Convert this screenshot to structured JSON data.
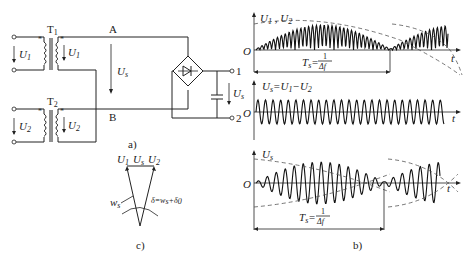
{
  "circuit": {
    "transformer1_label": "T",
    "transformer1_sub": "1",
    "transformer2_label": "T",
    "transformer2_sub": "2",
    "node_a": "A",
    "node_b": "B",
    "input1_label": "U",
    "input1_sub": "1",
    "output1_label": "U",
    "output1_sub": "1",
    "input2_label": "U",
    "input2_sub": "2",
    "output2_label": "U",
    "output2_sub": "2",
    "diff_voltage_label": "U",
    "diff_voltage_sub": "s",
    "terminal1": "1",
    "terminal2": "2",
    "out_voltage_label": "U",
    "out_voltage_sub": "s",
    "caption": "a)"
  },
  "phasor": {
    "u1_label": "U",
    "u1_sub": "1",
    "us_label": "U",
    "us_sub": "s",
    "u2_label": "U",
    "u2_sub": "2",
    "ws_label": "w",
    "ws_sub": "s",
    "delta_label": "δ=w",
    "delta_sub1": "s",
    "delta_plus": "+δ",
    "delta_sub2": "0",
    "caption": "c)"
  },
  "waveforms": {
    "top": {
      "ylabel": "U",
      "ylabel_sub1": "1",
      "ylabel_mid": " , U",
      "ylabel_sub2": "2",
      "origin": "O",
      "xlabel": "t",
      "period_label": "T",
      "period_sub": "s",
      "period_eq": "=",
      "period_num": "1",
      "period_den": "Δf"
    },
    "middle": {
      "ylabel": "U",
      "ylabel_sub": "s",
      "eq": "=U",
      "eq_sub1": "1",
      "minus": "−U",
      "eq_sub2": "2",
      "origin": "O",
      "xlabel": "t"
    },
    "bottom": {
      "ylabel": "U",
      "ylabel_sub": "s",
      "origin": "O",
      "xlabel": "t",
      "period_label": "T",
      "period_sub": "s",
      "period_eq": "=",
      "period_num": "1",
      "period_den": "Δf"
    },
    "caption": "b)"
  }
}
